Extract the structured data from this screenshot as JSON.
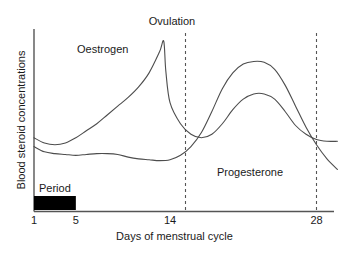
{
  "chart_data": {
    "type": "line",
    "title": "",
    "xlabel": "Days of menstrual cycle",
    "ylabel": "Blood steroid concentrations",
    "xlim": [
      1,
      30
    ],
    "ylim": [
      0,
      1
    ],
    "grid": false,
    "legend": "inline-annotations",
    "xticks": [
      "1",
      "5",
      "14",
      "28"
    ],
    "xtick_values": [
      1,
      5,
      14,
      28
    ],
    "yticks": [],
    "annotations": [
      {
        "name": "ovulation",
        "text": "Ovulation",
        "x": 14,
        "type": "vertical-dashed-marker"
      },
      {
        "name": "oestrogen",
        "text": "Oestrogen",
        "x": 6.5,
        "type": "series-label"
      },
      {
        "name": "progesterone",
        "text": "Progesterone",
        "x": 20,
        "type": "series-label"
      },
      {
        "name": "period",
        "text": "Period",
        "x": 1,
        "type": "bar-label"
      }
    ],
    "vertical_markers": [
      14,
      28
    ],
    "period_bar": {
      "label": "Period",
      "start_day": 1,
      "end_day": 5,
      "color": "#000000"
    },
    "series": [
      {
        "name": "Oestrogen",
        "color": "#4d4d4d",
        "points": [
          [
            1,
            0.42
          ],
          [
            2,
            0.39
          ],
          [
            3,
            0.38
          ],
          [
            4,
            0.39
          ],
          [
            5,
            0.42
          ],
          [
            6,
            0.46
          ],
          [
            7,
            0.5
          ],
          [
            8,
            0.55
          ],
          [
            9,
            0.6
          ],
          [
            10,
            0.65
          ],
          [
            11,
            0.71
          ],
          [
            12,
            0.79
          ],
          [
            13,
            0.91
          ],
          [
            13.4,
            0.97
          ],
          [
            13.6,
            0.8
          ],
          [
            14,
            0.62
          ],
          [
            15,
            0.5
          ],
          [
            16,
            0.44
          ],
          [
            17,
            0.42
          ],
          [
            18,
            0.44
          ],
          [
            19,
            0.5
          ],
          [
            20,
            0.58
          ],
          [
            21,
            0.64
          ],
          [
            22,
            0.67
          ],
          [
            23,
            0.67
          ],
          [
            24,
            0.64
          ],
          [
            25,
            0.57
          ],
          [
            26,
            0.49
          ],
          [
            27,
            0.44
          ],
          [
            28,
            0.41
          ],
          [
            29,
            0.4
          ],
          [
            30,
            0.4
          ]
        ]
      },
      {
        "name": "Progesterone",
        "color": "#4d4d4d",
        "points": [
          [
            1,
            0.37
          ],
          [
            2,
            0.34
          ],
          [
            3,
            0.33
          ],
          [
            4,
            0.325
          ],
          [
            5,
            0.32
          ],
          [
            6,
            0.325
          ],
          [
            7,
            0.33
          ],
          [
            8,
            0.33
          ],
          [
            9,
            0.325
          ],
          [
            10,
            0.31
          ],
          [
            11,
            0.3
          ],
          [
            12,
            0.295
          ],
          [
            13,
            0.29
          ],
          [
            14,
            0.295
          ],
          [
            15,
            0.32
          ],
          [
            16,
            0.37
          ],
          [
            17,
            0.45
          ],
          [
            18,
            0.57
          ],
          [
            19,
            0.7
          ],
          [
            20,
            0.79
          ],
          [
            21,
            0.84
          ],
          [
            22,
            0.855
          ],
          [
            23,
            0.85
          ],
          [
            24,
            0.81
          ],
          [
            25,
            0.72
          ],
          [
            26,
            0.6
          ],
          [
            27,
            0.48
          ],
          [
            28,
            0.38
          ],
          [
            29,
            0.3
          ],
          [
            30,
            0.24
          ]
        ]
      }
    ]
  }
}
